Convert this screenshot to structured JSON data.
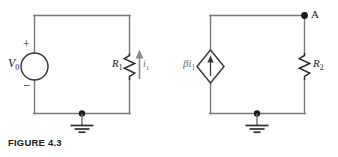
{
  "figure": {
    "caption": "FIGURE 4.3",
    "background_color": "#ffffff",
    "wire_color": "#777777",
    "component_color": "#2b2b2b",
    "label_color": "#1a1a1a",
    "arrow_color": "#8a8a8a"
  },
  "circuit_left": {
    "name": "independent-source-circuit",
    "source": {
      "type": "independent-voltage-source",
      "symbol": "circle",
      "label": "V",
      "label_subscript": "0",
      "polarity_plus": "+",
      "polarity_minus": "−"
    },
    "resistor": {
      "type": "resistor",
      "symbol": "zigzag",
      "label": "R",
      "label_subscript": "1"
    },
    "current": {
      "label": "i",
      "label_subscript": "1",
      "direction": "up"
    },
    "ground": {
      "symbol": "earth-ground",
      "bars": 3
    }
  },
  "circuit_right": {
    "name": "dependent-source-circuit",
    "source": {
      "type": "dependent-current-source",
      "symbol": "diamond",
      "label_beta": "β",
      "label": "i",
      "label_subscript": "1",
      "direction": "up"
    },
    "resistor": {
      "type": "resistor",
      "symbol": "zigzag",
      "label": "R",
      "label_subscript": "2"
    },
    "node": {
      "label": "A",
      "marker": "filled-dot"
    },
    "ground": {
      "symbol": "earth-ground",
      "bars": 3
    }
  }
}
